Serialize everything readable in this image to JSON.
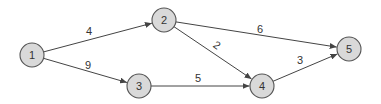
{
  "diagram": {
    "type": "weighted-directed-graph",
    "colors": {
      "node_fill": "#d9d9d9",
      "node_stroke": "#555555",
      "edge": "#444444",
      "text": "#333333",
      "background": "#ffffff"
    },
    "nodes": [
      {
        "id": "1",
        "label": "1",
        "x": 32,
        "y": 55
      },
      {
        "id": "2",
        "label": "2",
        "x": 164,
        "y": 20
      },
      {
        "id": "3",
        "label": "3",
        "x": 139,
        "y": 86
      },
      {
        "id": "4",
        "label": "4",
        "x": 262,
        "y": 86
      },
      {
        "id": "5",
        "label": "5",
        "x": 349,
        "y": 49
      }
    ],
    "edges": [
      {
        "from": "1",
        "to": "2",
        "weight": "4",
        "label_x": 89,
        "label_y": 35,
        "label_rotate": 0
      },
      {
        "from": "1",
        "to": "3",
        "weight": "9",
        "label_x": 88,
        "label_y": 69,
        "label_rotate": 0
      },
      {
        "from": "2",
        "to": "5",
        "weight": "6",
        "label_x": 260,
        "label_y": 33,
        "label_rotate": 0
      },
      {
        "from": "2",
        "to": "4",
        "weight": "2",
        "label_x": 217,
        "label_y": 49,
        "label_rotate": 35
      },
      {
        "from": "3",
        "to": "4",
        "weight": "5",
        "label_x": 198,
        "label_y": 82,
        "label_rotate": 0
      },
      {
        "from": "4",
        "to": "5",
        "weight": "3",
        "label_x": 300,
        "label_y": 64,
        "label_rotate": 0
      }
    ]
  }
}
